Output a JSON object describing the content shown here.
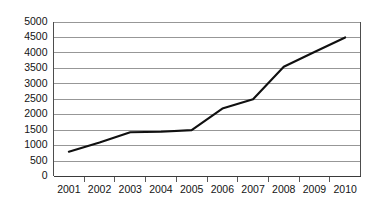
{
  "chart_data": {
    "type": "line",
    "title": "",
    "subtitle": "",
    "xlabel": "",
    "ylabel": "",
    "categories": [
      "2001",
      "2002",
      "2003",
      "2004",
      "2005",
      "2006",
      "2007",
      "2008",
      "2009",
      "2010"
    ],
    "series": [
      {
        "name": "series-1",
        "values": [
          800,
          1100,
          1430,
          1450,
          1500,
          2200,
          2500,
          3550,
          4030,
          4500
        ],
        "color": "#101010"
      }
    ],
    "ylim": [
      0,
      5000
    ],
    "ytick_labels": [
      "0",
      "500",
      "1000",
      "1500",
      "2000",
      "2500",
      "3000",
      "3500",
      "4000",
      "4500",
      "5000"
    ],
    "ytick_values": [
      0,
      500,
      1000,
      1500,
      2000,
      2500,
      3000,
      3500,
      4000,
      4500,
      5000
    ],
    "xtick_labels": [
      "2001",
      "2002",
      "2003",
      "2004",
      "2005",
      "2006",
      "2007",
      "2008",
      "2009",
      "2010"
    ],
    "grid": true,
    "grid_axis": "y",
    "legend": false,
    "legend_position": "none",
    "annotations": [],
    "colors": {
      "line": "#101010",
      "grid": "#8c8c8c",
      "axis": "#4d4d4d",
      "text": "#141414",
      "background": "#ffffff"
    }
  }
}
